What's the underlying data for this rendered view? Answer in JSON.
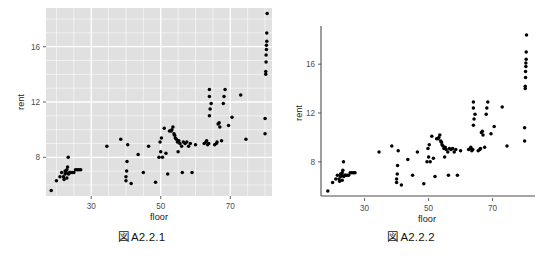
{
  "page": {
    "background": "#ffffff",
    "width": 539,
    "height": 258
  },
  "figures": [
    {
      "id": "figure-a221",
      "caption_mark": "図",
      "caption_label": "A2.2.1",
      "theme": "grey",
      "panel_fill": "#e0e0e0",
      "grid_color": "#ffffff",
      "point_color": "#000000"
    },
    {
      "id": "figure-a222",
      "caption_mark": "図",
      "caption_label": "A2.2.2",
      "theme": "classic",
      "panel_fill": "#ffffff",
      "axis_color": "#4d4d4d",
      "point_color": "#000000"
    }
  ],
  "chart_data": [
    {
      "type": "scatter",
      "title": "",
      "xlabel": "floor",
      "ylabel": "rent",
      "xticks": [
        30,
        50,
        70
      ],
      "yticks": [
        8,
        12,
        16
      ],
      "xlim": [
        17,
        82
      ],
      "ylim": [
        5.2,
        18.8
      ],
      "grid": true,
      "legend": "none",
      "theme": "grey",
      "points": [
        [
          18.5,
          5.6
        ],
        [
          20.0,
          6.3
        ],
        [
          21.0,
          6.6
        ],
        [
          21.5,
          6.9
        ],
        [
          22.0,
          6.6
        ],
        [
          22.2,
          6.4
        ],
        [
          22.5,
          7.0
        ],
        [
          22.5,
          6.8
        ],
        [
          22.8,
          6.9
        ],
        [
          23.0,
          7.1
        ],
        [
          23.0,
          6.5
        ],
        [
          23.2,
          7.3
        ],
        [
          23.4,
          8.0
        ],
        [
          23.5,
          6.8
        ],
        [
          23.8,
          6.9
        ],
        [
          24.0,
          6.9
        ],
        [
          24.5,
          6.9
        ],
        [
          25.0,
          6.9
        ],
        [
          25.5,
          7.1
        ],
        [
          26.0,
          7.1
        ],
        [
          26.5,
          7.1
        ],
        [
          27.0,
          7.1
        ],
        [
          34.5,
          8.8
        ],
        [
          38.5,
          9.3
        ],
        [
          40.0,
          6.3
        ],
        [
          40.0,
          6.6
        ],
        [
          40.2,
          7.0
        ],
        [
          40.3,
          7.7
        ],
        [
          40.5,
          8.9
        ],
        [
          41.5,
          6.1
        ],
        [
          43.5,
          8.2
        ],
        [
          45.0,
          6.9
        ],
        [
          46.5,
          8.8
        ],
        [
          48.5,
          6.2
        ],
        [
          49.5,
          8.0
        ],
        [
          49.8,
          9.1
        ],
        [
          50.0,
          8.4
        ],
        [
          50.2,
          9.4
        ],
        [
          50.5,
          8.0
        ],
        [
          51.0,
          10.1
        ],
        [
          51.5,
          8.3
        ],
        [
          52.0,
          6.8
        ],
        [
          52.5,
          9.9
        ],
        [
          53.0,
          9.9
        ],
        [
          53.2,
          10.0
        ],
        [
          53.5,
          10.2
        ],
        [
          53.8,
          9.7
        ],
        [
          54.0,
          9.6
        ],
        [
          54.2,
          9.4
        ],
        [
          54.5,
          9.3
        ],
        [
          54.8,
          9.1
        ],
        [
          55.0,
          8.4
        ],
        [
          55.2,
          9.2
        ],
        [
          55.5,
          9.0
        ],
        [
          56.0,
          8.8
        ],
        [
          56.2,
          6.9
        ],
        [
          56.5,
          9.1
        ],
        [
          57.0,
          9.0
        ],
        [
          57.5,
          9.1
        ],
        [
          58.0,
          8.8
        ],
        [
          58.5,
          9.0
        ],
        [
          59.0,
          6.9
        ],
        [
          60.0,
          8.9
        ],
        [
          62.5,
          9.0
        ],
        [
          63.0,
          9.1
        ],
        [
          63.2,
          9.2
        ],
        [
          63.5,
          8.9
        ],
        [
          63.8,
          9.0
        ],
        [
          64.0,
          11.0
        ],
        [
          64.0,
          12.4
        ],
        [
          64.0,
          12.9
        ],
        [
          64.2,
          11.5
        ],
        [
          64.5,
          11.9
        ],
        [
          65.5,
          8.9
        ],
        [
          66.0,
          9.0
        ],
        [
          66.2,
          9.1
        ],
        [
          66.5,
          10.4
        ],
        [
          66.8,
          10.5
        ],
        [
          67.0,
          10.2
        ],
        [
          67.5,
          9.2
        ],
        [
          68.0,
          11.9
        ],
        [
          68.2,
          12.4
        ],
        [
          68.5,
          12.9
        ],
        [
          69.5,
          10.3
        ],
        [
          70.5,
          10.9
        ],
        [
          73.0,
          12.5
        ],
        [
          74.5,
          9.3
        ],
        [
          80.0,
          9.7
        ],
        [
          80.0,
          10.8
        ],
        [
          80.2,
          14.0
        ],
        [
          80.2,
          14.2
        ],
        [
          80.3,
          14.9
        ],
        [
          80.3,
          15.4
        ],
        [
          80.4,
          15.8
        ],
        [
          80.4,
          16.1
        ],
        [
          80.5,
          16.4
        ],
        [
          80.5,
          17.0
        ],
        [
          80.6,
          18.4
        ]
      ]
    },
    {
      "type": "scatter",
      "title": "",
      "xlabel": "floor",
      "ylabel": "rent",
      "xticks": [
        30,
        50,
        70
      ],
      "yticks": [
        8,
        12,
        16
      ],
      "xlim": [
        17,
        82
      ],
      "ylim": [
        5.2,
        18.8
      ],
      "grid": false,
      "legend": "none",
      "theme": "classic",
      "points": [
        [
          18.5,
          5.6
        ],
        [
          20.0,
          6.3
        ],
        [
          21.0,
          6.6
        ],
        [
          21.5,
          6.9
        ],
        [
          22.0,
          6.6
        ],
        [
          22.2,
          6.4
        ],
        [
          22.5,
          7.0
        ],
        [
          22.5,
          6.8
        ],
        [
          22.8,
          6.9
        ],
        [
          23.0,
          7.1
        ],
        [
          23.0,
          6.5
        ],
        [
          23.2,
          7.3
        ],
        [
          23.4,
          8.0
        ],
        [
          23.5,
          6.8
        ],
        [
          23.8,
          6.9
        ],
        [
          24.0,
          6.9
        ],
        [
          24.5,
          6.9
        ],
        [
          25.0,
          6.9
        ],
        [
          25.5,
          7.1
        ],
        [
          26.0,
          7.1
        ],
        [
          26.5,
          7.1
        ],
        [
          27.0,
          7.1
        ],
        [
          34.5,
          8.8
        ],
        [
          38.5,
          9.3
        ],
        [
          40.0,
          6.3
        ],
        [
          40.0,
          6.6
        ],
        [
          40.2,
          7.0
        ],
        [
          40.3,
          7.7
        ],
        [
          40.5,
          8.9
        ],
        [
          41.5,
          6.1
        ],
        [
          43.5,
          8.2
        ],
        [
          45.0,
          6.9
        ],
        [
          46.5,
          8.8
        ],
        [
          48.5,
          6.2
        ],
        [
          49.5,
          8.0
        ],
        [
          49.8,
          9.1
        ],
        [
          50.0,
          8.4
        ],
        [
          50.2,
          9.4
        ],
        [
          50.5,
          8.0
        ],
        [
          51.0,
          10.1
        ],
        [
          51.5,
          8.3
        ],
        [
          52.0,
          6.8
        ],
        [
          52.5,
          9.9
        ],
        [
          53.0,
          9.9
        ],
        [
          53.2,
          10.0
        ],
        [
          53.5,
          10.2
        ],
        [
          53.8,
          9.7
        ],
        [
          54.0,
          9.6
        ],
        [
          54.2,
          9.4
        ],
        [
          54.5,
          9.3
        ],
        [
          54.8,
          9.1
        ],
        [
          55.0,
          8.4
        ],
        [
          55.2,
          9.2
        ],
        [
          55.5,
          9.0
        ],
        [
          56.0,
          8.8
        ],
        [
          56.2,
          6.9
        ],
        [
          56.5,
          9.1
        ],
        [
          57.0,
          9.0
        ],
        [
          57.5,
          9.1
        ],
        [
          58.0,
          8.8
        ],
        [
          58.5,
          9.0
        ],
        [
          59.0,
          6.9
        ],
        [
          60.0,
          8.9
        ],
        [
          62.5,
          9.0
        ],
        [
          63.0,
          9.1
        ],
        [
          63.2,
          9.2
        ],
        [
          63.5,
          8.9
        ],
        [
          63.8,
          9.0
        ],
        [
          64.0,
          11.0
        ],
        [
          64.0,
          12.4
        ],
        [
          64.0,
          12.9
        ],
        [
          64.2,
          11.5
        ],
        [
          64.5,
          11.9
        ],
        [
          65.5,
          8.9
        ],
        [
          66.0,
          9.0
        ],
        [
          66.2,
          9.1
        ],
        [
          66.5,
          10.4
        ],
        [
          66.8,
          10.5
        ],
        [
          67.0,
          10.2
        ],
        [
          67.5,
          9.2
        ],
        [
          68.0,
          11.9
        ],
        [
          68.2,
          12.4
        ],
        [
          68.5,
          12.9
        ],
        [
          69.5,
          10.3
        ],
        [
          70.5,
          10.9
        ],
        [
          73.0,
          12.5
        ],
        [
          74.5,
          9.3
        ],
        [
          80.0,
          9.7
        ],
        [
          80.0,
          10.8
        ],
        [
          80.2,
          14.0
        ],
        [
          80.2,
          14.2
        ],
        [
          80.3,
          14.9
        ],
        [
          80.3,
          15.4
        ],
        [
          80.4,
          15.8
        ],
        [
          80.4,
          16.1
        ],
        [
          80.5,
          16.4
        ],
        [
          80.5,
          17.0
        ],
        [
          80.6,
          18.4
        ]
      ]
    }
  ]
}
